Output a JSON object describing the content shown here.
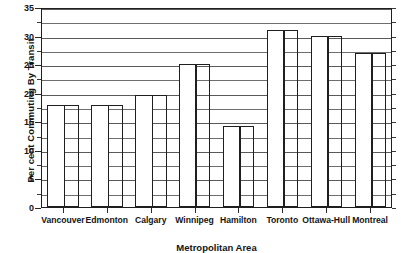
{
  "chart_data": {
    "type": "bar",
    "title": "",
    "xlabel": "Metropolitan Area",
    "ylabel": "Per cent Commuting By Transit",
    "categories": [
      "Vancouver",
      "Edmonton",
      "Calgary",
      "Winnipeg",
      "Hamilton",
      "Toronto",
      "Ottawa-Hull",
      "Montreal"
    ],
    "values": [
      17.8,
      17.8,
      19.6,
      25.0,
      14.2,
      31.0,
      30.0,
      27.0
    ],
    "ylim": [
      0,
      35
    ],
    "ytick_labels": [
      "0",
      "5",
      "10",
      "15",
      "20",
      "25",
      "30",
      "35"
    ],
    "ytick_values": [
      0,
      5,
      10,
      15,
      20,
      25,
      30,
      35
    ],
    "yminor_values": [
      2.5,
      7.5,
      12.5,
      17.5,
      22.5,
      27.5,
      32.5
    ],
    "gridline_values": [
      2.5,
      5,
      7.5,
      10,
      12.5,
      15,
      17.5,
      20,
      22.5,
      25,
      27.5,
      30,
      32.5,
      35
    ],
    "grid": true,
    "legend": "none",
    "bar_style": "paired-wide-solid-and-narrow-open",
    "colors": {
      "bar_fill": "#ffffff",
      "bar_edge": "#1f1f1f",
      "grid": "#6e6e6e",
      "axis": "#1f1f1f",
      "text": "#141414",
      "background": "#ffffff"
    }
  }
}
